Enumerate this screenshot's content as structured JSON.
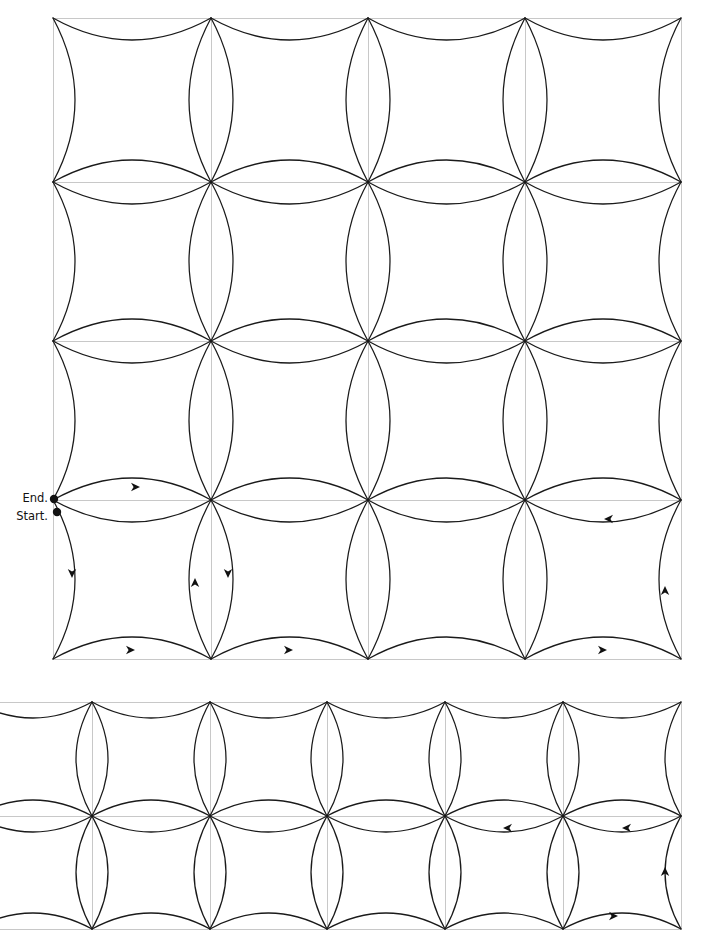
{
  "figure": {
    "type": "diagram",
    "background_color": "#ffffff",
    "grid_color": "#c8c8c8",
    "arc_color": "#1a1a1a",
    "dot_color": "#111111"
  },
  "labels": {
    "end": "End.",
    "start": "Start."
  },
  "label_positions": {
    "end": {
      "x": 48,
      "y": 502
    },
    "start": {
      "x": 48,
      "y": 520
    }
  },
  "markers": {
    "end_dot": {
      "x": 54,
      "y": 499,
      "r": 4.2
    },
    "start_dot": {
      "x": 57,
      "y": 512,
      "r": 4.2
    }
  },
  "panels": [
    {
      "name": "upper-lattice",
      "x_lines": [
        53,
        211,
        368,
        525,
        681
      ],
      "y_lines": [
        18,
        182,
        341,
        500,
        659
      ],
      "cell_w": 157,
      "cell_h": 160,
      "h_bulge": 22,
      "v_bulge": 22
    },
    {
      "name": "lower-lattice",
      "x_lines": [
        -26,
        92,
        210,
        327,
        445,
        563,
        681
      ],
      "y_lines": [
        702,
        816,
        929
      ],
      "cell_w": 118,
      "cell_h": 113,
      "h_bulge": 16,
      "v_bulge": 16
    }
  ],
  "arrows": [
    {
      "id": "a1",
      "panel": "upper-lattice",
      "x": 140,
      "y": 487,
      "dir": "right"
    },
    {
      "id": "a2",
      "panel": "upper-lattice",
      "x": 604,
      "y": 519,
      "dir": "left"
    },
    {
      "id": "a3",
      "panel": "upper-lattice",
      "x": 72,
      "y": 578,
      "dir": "down"
    },
    {
      "id": "a4",
      "panel": "upper-lattice",
      "x": 195,
      "y": 578,
      "dir": "up"
    },
    {
      "id": "a5",
      "panel": "upper-lattice",
      "x": 228,
      "y": 578,
      "dir": "down"
    },
    {
      "id": "a6",
      "panel": "upper-lattice",
      "x": 665,
      "y": 586,
      "dir": "up"
    },
    {
      "id": "a7",
      "panel": "upper-lattice",
      "x": 135,
      "y": 650,
      "dir": "right"
    },
    {
      "id": "a8",
      "panel": "upper-lattice",
      "x": 293,
      "y": 650,
      "dir": "right"
    },
    {
      "id": "a9",
      "panel": "upper-lattice",
      "x": 607,
      "y": 650,
      "dir": "right"
    },
    {
      "id": "a10",
      "panel": "lower-lattice",
      "x": 503,
      "y": 828,
      "dir": "left"
    },
    {
      "id": "a11",
      "panel": "lower-lattice",
      "x": 622,
      "y": 828,
      "dir": "left"
    },
    {
      "id": "a12",
      "panel": "lower-lattice",
      "x": 665,
      "y": 867,
      "dir": "up"
    },
    {
      "id": "a13",
      "panel": "lower-lattice",
      "x": 618,
      "y": 916,
      "dir": "right"
    }
  ]
}
